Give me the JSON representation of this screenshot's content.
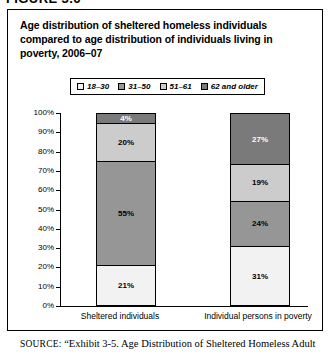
{
  "figure": {
    "number_label": "FIGURE 3.6",
    "title": "Age distribution of sheltered homeless individuals compared to age distribution of individuals living in poverty, 2006–07"
  },
  "source": {
    "kicker": "SOURCE:",
    "text": "“Exhibit 3-5. Age Distribution of Sheltered Homeless Adult"
  },
  "colors": {
    "age_18_30": "#f2f2f2",
    "age_31_50": "#969696",
    "age_51_61": "#cccccc",
    "age_62_older": "#7a7a7a",
    "axis": "#000000",
    "panel_border": "#000000",
    "background": "#ffffff"
  },
  "chart_data": {
    "type": "bar",
    "subtype": "100% stacked column",
    "title": "Age distribution of sheltered homeless individuals compared to age distribution of individuals living in poverty, 2006–07",
    "xlabel": "",
    "ylabel": "",
    "ylim": [
      0,
      100
    ],
    "ytick_labels": [
      "0%",
      "10%",
      "20%",
      "30%",
      "40%",
      "50%",
      "60%",
      "70%",
      "80%",
      "90%",
      "100%"
    ],
    "ytick_values": [
      0,
      10,
      20,
      30,
      40,
      50,
      60,
      70,
      80,
      90,
      100
    ],
    "grid": false,
    "legend_position": "top-center",
    "categories": [
      "Sheltered individuals",
      "Individual persons in poverty"
    ],
    "series": [
      {
        "name": "18–30",
        "color": "#f2f2f2",
        "values": [
          21,
          31
        ],
        "labels": [
          "21%",
          "31%"
        ]
      },
      {
        "name": "31–50",
        "color": "#969696",
        "values": [
          55,
          24
        ],
        "labels": [
          "55%",
          "24%"
        ]
      },
      {
        "name": "51–61",
        "color": "#cccccc",
        "values": [
          20,
          19
        ],
        "labels": [
          "20%",
          "19%"
        ]
      },
      {
        "name": "62 and older",
        "color": "#7a7a7a",
        "values": [
          4,
          27
        ],
        "labels": [
          "4%",
          "27%"
        ]
      }
    ]
  }
}
